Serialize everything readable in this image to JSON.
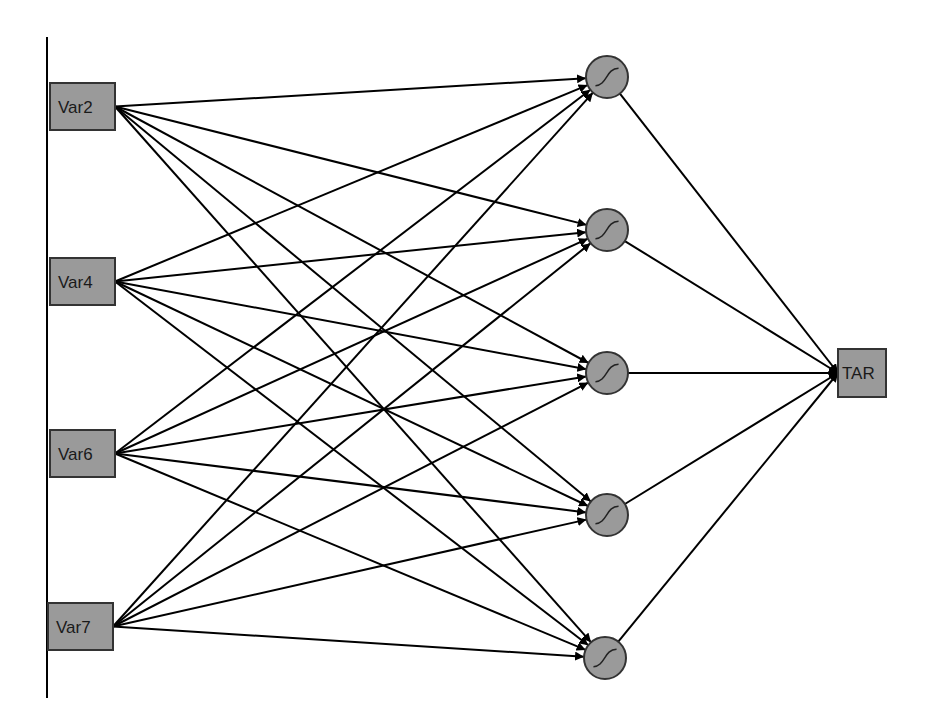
{
  "diagram": {
    "type": "neural-network",
    "colors": {
      "node_fill": "#9a9a9a",
      "node_stroke": "#333333",
      "edge": "#000000",
      "background": "#ffffff"
    },
    "input_bus": {
      "x": 47,
      "y1": 37,
      "y2": 698
    },
    "input_nodes": [
      {
        "id": "var2",
        "label": "Var2",
        "x": 50,
        "y": 83,
        "w": 65,
        "h": 47
      },
      {
        "id": "var4",
        "label": "Var4",
        "x": 50,
        "y": 258,
        "w": 65,
        "h": 47
      },
      {
        "id": "var6",
        "label": "Var6",
        "x": 50,
        "y": 430,
        "w": 65,
        "h": 47
      },
      {
        "id": "var7",
        "label": "Var7",
        "x": 48,
        "y": 603,
        "w": 65,
        "h": 47
      }
    ],
    "hidden_nodes": [
      {
        "id": "h1",
        "label": "",
        "activation": "sigmoid-icon",
        "cx": 607,
        "cy": 77,
        "r": 21
      },
      {
        "id": "h2",
        "label": "",
        "activation": "sigmoid-icon",
        "cx": 607,
        "cy": 230,
        "r": 21
      },
      {
        "id": "h3",
        "label": "",
        "activation": "sigmoid-icon",
        "cx": 607,
        "cy": 373,
        "r": 21
      },
      {
        "id": "h4",
        "label": "",
        "activation": "sigmoid-icon",
        "cx": 607,
        "cy": 515,
        "r": 21
      },
      {
        "id": "h5",
        "label": "",
        "activation": "sigmoid-icon",
        "cx": 605,
        "cy": 658,
        "r": 21
      }
    ],
    "output_nodes": [
      {
        "id": "tar",
        "label": "TAR",
        "x": 838,
        "y": 349,
        "w": 48,
        "h": 48
      }
    ]
  }
}
